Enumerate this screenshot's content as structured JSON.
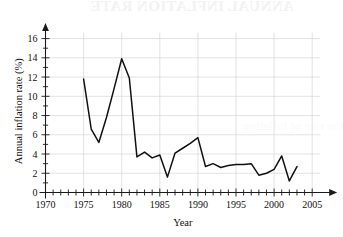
{
  "figure": {
    "watermark_top": "ANNUAL INFLATION RATE",
    "watermark_mid": "the rate of inflation",
    "background_color": "#ffffff",
    "line_color": "#111111",
    "grid_color": "#d6d6d6",
    "axis_color": "#1a1a1a"
  },
  "chart_data": {
    "type": "line",
    "title": "",
    "xlabel": "Year",
    "ylabel": "Annual inflation rate (%)",
    "xlim": [
      1970,
      2006
    ],
    "ylim": [
      0,
      17
    ],
    "grid": true,
    "legend": null,
    "x_major_ticks": [
      1970,
      1975,
      1980,
      1985,
      1990,
      1995,
      2000,
      2005
    ],
    "x_tick_labels": [
      "1970",
      "1975",
      "1980",
      "1985",
      "1990",
      "1995",
      "2000",
      "2005"
    ],
    "x_minor_tick_step": 1,
    "y_major_ticks": [
      0,
      2,
      4,
      6,
      8,
      10,
      12,
      14,
      16
    ],
    "y_tick_labels": [
      "0",
      "2",
      "4",
      "6",
      "8",
      "10",
      "12",
      "14",
      "16"
    ],
    "y_minor_tick_step": 1,
    "x": [
      1975,
      1976,
      1977,
      1978,
      1979,
      1980,
      1981,
      1982,
      1983,
      1984,
      1985,
      1986,
      1987,
      1988,
      1989,
      1990,
      1991,
      1992,
      1993,
      1994,
      1995,
      1996,
      1997,
      1998,
      1999,
      2000,
      2001,
      2002,
      2003
    ],
    "values": [
      11.8,
      6.6,
      5.2,
      7.8,
      10.8,
      13.9,
      11.9,
      3.7,
      4.2,
      3.6,
      3.9,
      1.6,
      4.1,
      4.6,
      5.1,
      5.7,
      2.7,
      3.0,
      2.6,
      2.8,
      2.9,
      2.9,
      3.0,
      1.8,
      2.0,
      2.4,
      3.8,
      1.2,
      2.7
    ],
    "series_name": "Annual inflation rate"
  }
}
